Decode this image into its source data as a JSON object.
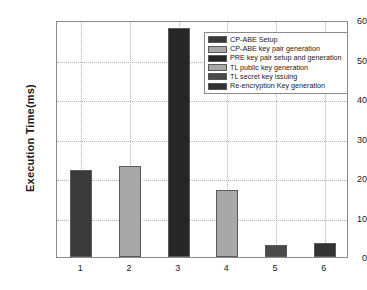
{
  "chart_data": {
    "type": "bar",
    "title": "",
    "xlabel": "",
    "ylabel": "Execution Time(ms)",
    "categories": [
      "1",
      "2",
      "3",
      "4",
      "5",
      "6"
    ],
    "values": [
      22,
      23,
      58,
      17,
      3,
      3.5
    ],
    "ylim": [
      0,
      60
    ],
    "yticks": [
      0,
      10,
      20,
      30,
      40,
      50,
      60
    ],
    "ytick_labels": [
      "0",
      "10",
      "20",
      "30",
      "40",
      "50",
      "60"
    ],
    "grid": true,
    "legend_position": "upper right",
    "series": [
      {
        "name": "CP-ABE Setup",
        "category": "1",
        "value": 22,
        "color": "#3a3a3a"
      },
      {
        "name": "CP-ABE key pair generation",
        "category": "2",
        "value": 23,
        "color": "#a8a8a8"
      },
      {
        "name": "PRE key pair setup and generation",
        "category": "3",
        "value": 58,
        "color": "#262626"
      },
      {
        "name": "TL public key generation",
        "category": "4",
        "value": 17,
        "color": "#a8a8a8"
      },
      {
        "name": "TL secret key issuing",
        "category": "5",
        "value": 3,
        "color": "#4a4a4a"
      },
      {
        "name": "Re-encryption Key generation",
        "category": "6",
        "value": 3.5,
        "color": "#333333"
      }
    ]
  },
  "axes": {
    "y_title": "Execution Time(ms)"
  }
}
